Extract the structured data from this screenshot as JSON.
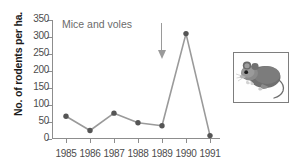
{
  "chart_data": {
    "type": "line",
    "title": "Mice and voles",
    "xlabel": "",
    "ylabel": "No. of rodents per ha.",
    "categories": [
      "1985",
      "1986",
      "1987",
      "1988",
      "1989",
      "1990",
      "1991"
    ],
    "values": [
      67,
      25,
      76,
      48,
      39,
      310,
      10
    ],
    "yticks": [
      0,
      50,
      100,
      150,
      200,
      250,
      300,
      350
    ],
    "ylim": [
      0,
      350
    ],
    "grid": false,
    "legend": null,
    "marker": "circle",
    "line_color": "#9a9a9a",
    "marker_color": "#555555",
    "annotations": [
      {
        "type": "arrow",
        "direction": "down",
        "at_category": "1989",
        "label": ""
      }
    ]
  },
  "figure": {
    "title": "Mice and voles",
    "y_axis_title": "No. of rodents per ha.",
    "illustration": {
      "name": "mouse-illustration",
      "caption": ""
    }
  },
  "colors": {
    "axis": "#8d8d8d",
    "tick_text": "#4d4d4d",
    "title_text": "#6b6b6b",
    "label_text": "#1b1b1b",
    "line": "#9a9a9a",
    "marker": "#555555",
    "arrow": "#9a9a9a",
    "frame": "#7d7d7d",
    "background": "#ffffff"
  }
}
